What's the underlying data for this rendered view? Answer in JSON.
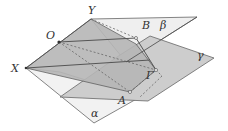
{
  "diagram": {
    "type": "3d-geometry-planes",
    "planes": [
      {
        "name": "alpha",
        "label": "α"
      },
      {
        "name": "beta",
        "label": "β"
      },
      {
        "name": "gamma",
        "label": "γ"
      }
    ],
    "points": [
      {
        "name": "X",
        "label": "X"
      },
      {
        "name": "O",
        "label": "O"
      },
      {
        "name": "Y",
        "label": "Y"
      },
      {
        "name": "A",
        "label": "A"
      },
      {
        "name": "B",
        "label": "B"
      },
      {
        "name": "Gamma",
        "label": "Γ"
      }
    ],
    "colors": {
      "dark_plane": "#b4b4b4",
      "mid_plane": "#cfcfcf",
      "light_plane": "#f0f0f0",
      "edge": "#555555",
      "dashed": "#666666"
    }
  }
}
